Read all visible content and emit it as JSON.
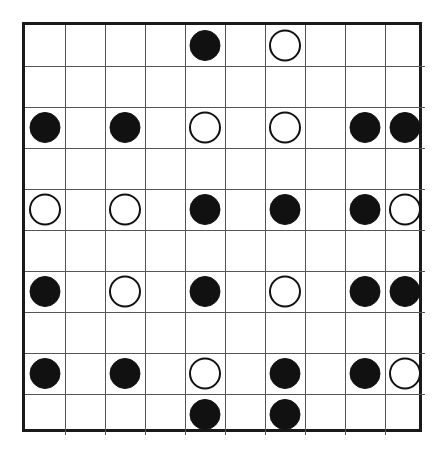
{
  "puzzle": {
    "type": "masyu-grid",
    "name": "Masyu puzzle grid",
    "rows": 10,
    "cols": 10,
    "cell_width": 40,
    "cell_height": 41,
    "origin_x": 22,
    "origin_y": 22,
    "circle_radius": 15,
    "colors": {
      "background": "#ffffff",
      "border": "#1a1a1a",
      "gridline": "#555555",
      "black_stone": "#111111",
      "white_stone_fill": "#ffffff",
      "white_stone_stroke": "#111111"
    },
    "border_width": 3,
    "gridline_width": 1,
    "stones": [
      {
        "row": 1,
        "col": 5,
        "kind": "black",
        "label": "black-circle-r1c5"
      },
      {
        "row": 1,
        "col": 7,
        "kind": "white",
        "label": "white-circle-r1c7"
      },
      {
        "row": 3,
        "col": 1,
        "kind": "black",
        "label": "black-circle-r3c1"
      },
      {
        "row": 3,
        "col": 3,
        "kind": "black",
        "label": "black-circle-r3c3"
      },
      {
        "row": 3,
        "col": 5,
        "kind": "white",
        "label": "white-circle-r3c5"
      },
      {
        "row": 3,
        "col": 7,
        "kind": "white",
        "label": "white-circle-r3c7"
      },
      {
        "row": 3,
        "col": 9,
        "kind": "black",
        "label": "black-circle-r3c9"
      },
      {
        "row": 3,
        "col": 10,
        "kind": "black",
        "label": "black-circle-r3c10"
      },
      {
        "row": 5,
        "col": 1,
        "kind": "white",
        "label": "white-circle-r5c1"
      },
      {
        "row": 5,
        "col": 3,
        "kind": "white",
        "label": "white-circle-r5c3"
      },
      {
        "row": 5,
        "col": 5,
        "kind": "black",
        "label": "black-circle-r5c5"
      },
      {
        "row": 5,
        "col": 7,
        "kind": "black",
        "label": "black-circle-r5c7"
      },
      {
        "row": 5,
        "col": 9,
        "kind": "black",
        "label": "black-circle-r5c9"
      },
      {
        "row": 5,
        "col": 10,
        "kind": "white",
        "label": "white-circle-r5c10"
      },
      {
        "row": 7,
        "col": 1,
        "kind": "black",
        "label": "black-circle-r7c1"
      },
      {
        "row": 7,
        "col": 3,
        "kind": "white",
        "label": "white-circle-r7c3"
      },
      {
        "row": 7,
        "col": 5,
        "kind": "black",
        "label": "black-circle-r7c5"
      },
      {
        "row": 7,
        "col": 7,
        "kind": "white",
        "label": "white-circle-r7c7"
      },
      {
        "row": 7,
        "col": 9,
        "kind": "black",
        "label": "black-circle-r7c9"
      },
      {
        "row": 7,
        "col": 10,
        "kind": "black",
        "label": "black-circle-r7c10"
      },
      {
        "row": 9,
        "col": 1,
        "kind": "black",
        "label": "black-circle-r9c1"
      },
      {
        "row": 9,
        "col": 3,
        "kind": "black",
        "label": "black-circle-r9c3"
      },
      {
        "row": 9,
        "col": 5,
        "kind": "white",
        "label": "white-circle-r9c5"
      },
      {
        "row": 9,
        "col": 7,
        "kind": "black",
        "label": "black-circle-r9c7"
      },
      {
        "row": 9,
        "col": 9,
        "kind": "black",
        "label": "black-circle-r9c9"
      },
      {
        "row": 9,
        "col": 10,
        "kind": "white",
        "label": "white-circle-r9c10"
      },
      {
        "row": 10,
        "col": 5,
        "kind": "black",
        "label": "black-circle-r10c5"
      },
      {
        "row": 10,
        "col": 7,
        "kind": "black",
        "label": "black-circle-r10c7"
      }
    ]
  }
}
